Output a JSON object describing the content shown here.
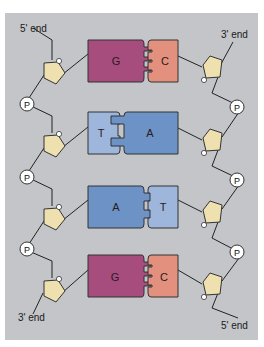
{
  "diagram": {
    "type": "dna-double-strand",
    "colors": {
      "background": "#c3c5c8",
      "guanine": "#a64d7e",
      "cytosine": "#e3907f",
      "thymine": "#9fb6dc",
      "adenine": "#6d92c6",
      "sugar": "#efe0b0",
      "phosphate": "#ffffff",
      "line": "#222222"
    },
    "ends": {
      "top_left": "5' end",
      "top_right": "3' end",
      "bottom_left": "3' end",
      "bottom_right": "5' end"
    },
    "phosphate_label": "P",
    "base_pairs": [
      {
        "left": "G",
        "right": "C",
        "bonds": 3
      },
      {
        "left": "T",
        "right": "A",
        "bonds": 2
      },
      {
        "left": "A",
        "right": "T",
        "bonds": 2
      },
      {
        "left": "G",
        "right": "C",
        "bonds": 3
      }
    ]
  }
}
